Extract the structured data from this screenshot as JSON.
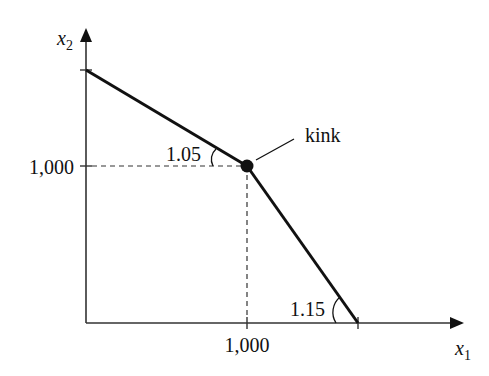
{
  "diagram": {
    "type": "kinked budget line",
    "axes": {
      "x_label": "x",
      "x_subscript": "1",
      "y_label": "x",
      "y_subscript": "2"
    },
    "ticks": {
      "x_tick_label": "1,000",
      "y_tick_label": "1,000"
    },
    "kink": {
      "label": "kink",
      "x": 1000,
      "y": 1000
    },
    "slopes": {
      "upper_segment_label": "1.05",
      "lower_segment_label": "1.15"
    },
    "colors": {
      "line": "#111111",
      "axis": "#333333",
      "background": "#ffffff"
    }
  }
}
